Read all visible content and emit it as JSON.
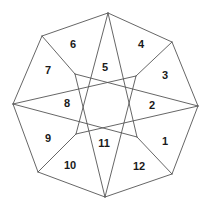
{
  "figure": {
    "canvas": {
      "width": 210,
      "height": 212
    },
    "style": {
      "background_color": "#ffffff",
      "stroke_color": "#555555",
      "stroke_width": 0.9,
      "label_color": "#1a1a1a",
      "label_font_size": 11
    },
    "vertices": {
      "outer": [
        {
          "name": "top",
          "x": 108,
          "y": 13
        },
        {
          "name": "upper-right",
          "x": 172,
          "y": 42
        },
        {
          "name": "right",
          "x": 198,
          "y": 106
        },
        {
          "name": "lower-right",
          "x": 172,
          "y": 174
        },
        {
          "name": "bottom",
          "x": 105,
          "y": 197
        },
        {
          "name": "lower-left",
          "x": 38,
          "y": 172
        },
        {
          "name": "left",
          "x": 13,
          "y": 104
        },
        {
          "name": "upper-left",
          "x": 42,
          "y": 36
        }
      ],
      "inner": [
        {
          "name": "center",
          "x": 107,
          "y": 107
        },
        {
          "name": "inner-upper-left",
          "x": 75,
          "y": 74
        },
        {
          "name": "inner-upper-right",
          "x": 136,
          "y": 76
        },
        {
          "name": "inner-lower-left",
          "x": 76,
          "y": 134
        },
        {
          "name": "inner-lower-right",
          "x": 137,
          "y": 137
        }
      ]
    },
    "edges": [
      {
        "name": "outer-top-to-upper-right",
        "x1": 108,
        "y1": 13,
        "x2": 172,
        "y2": 42
      },
      {
        "name": "outer-upper-right-to-right",
        "x1": 172,
        "y1": 42,
        "x2": 198,
        "y2": 106
      },
      {
        "name": "outer-right-to-lower-right",
        "x1": 198,
        "y1": 106,
        "x2": 172,
        "y2": 174
      },
      {
        "name": "outer-lower-right-to-bottom",
        "x1": 172,
        "y1": 174,
        "x2": 105,
        "y2": 197
      },
      {
        "name": "outer-bottom-to-lower-left",
        "x1": 105,
        "y1": 197,
        "x2": 38,
        "y2": 172
      },
      {
        "name": "outer-lower-left-to-left",
        "x1": 38,
        "y1": 172,
        "x2": 13,
        "y2": 104
      },
      {
        "name": "outer-left-to-upper-left",
        "x1": 13,
        "y1": 104,
        "x2": 42,
        "y2": 36
      },
      {
        "name": "outer-upper-left-to-top",
        "x1": 42,
        "y1": 36,
        "x2": 108,
        "y2": 13
      },
      {
        "name": "diagonal-top-to-inner-lower-left",
        "x1": 108,
        "y1": 13,
        "x2": 76,
        "y2": 134
      },
      {
        "name": "diagonal-top-to-inner-lower-right",
        "x1": 108,
        "y1": 13,
        "x2": 137,
        "y2": 137
      },
      {
        "name": "diagonal-left-to-inner-upper-right",
        "x1": 13,
        "y1": 104,
        "x2": 136,
        "y2": 76
      },
      {
        "name": "diagonal-left-to-inner-lower-right",
        "x1": 13,
        "y1": 104,
        "x2": 137,
        "y2": 137
      },
      {
        "name": "diagonal-right-to-inner-upper-left",
        "x1": 198,
        "y1": 106,
        "x2": 75,
        "y2": 74
      },
      {
        "name": "diagonal-right-to-inner-lower-left",
        "x1": 198,
        "y1": 106,
        "x2": 76,
        "y2": 134
      },
      {
        "name": "diagonal-bottom-to-inner-upper-left",
        "x1": 105,
        "y1": 197,
        "x2": 75,
        "y2": 74
      },
      {
        "name": "diagonal-bottom-to-inner-upper-right",
        "x1": 105,
        "y1": 197,
        "x2": 136,
        "y2": 76
      },
      {
        "name": "chord-upper-left-to-inner-upper-left",
        "x1": 42,
        "y1": 36,
        "x2": 75,
        "y2": 74
      },
      {
        "name": "chord-upper-right-to-inner-upper-right",
        "x1": 172,
        "y1": 42,
        "x2": 136,
        "y2": 76
      },
      {
        "name": "chord-lower-left-to-inner-lower-left",
        "x1": 38,
        "y1": 172,
        "x2": 76,
        "y2": 134
      },
      {
        "name": "chord-lower-right-to-inner-lower-right",
        "x1": 172,
        "y1": 174,
        "x2": 137,
        "y2": 137
      }
    ],
    "regions": [
      {
        "id": "region-1",
        "label": "1",
        "x": 165,
        "y": 141
      },
      {
        "id": "region-2",
        "label": "2",
        "x": 152,
        "y": 105
      },
      {
        "id": "region-3",
        "label": "3",
        "x": 165,
        "y": 75
      },
      {
        "id": "region-4",
        "label": "4",
        "x": 141,
        "y": 44
      },
      {
        "id": "region-5",
        "label": "5",
        "x": 105,
        "y": 67
      },
      {
        "id": "region-6",
        "label": "6",
        "x": 73,
        "y": 44
      },
      {
        "id": "region-7",
        "label": "7",
        "x": 48,
        "y": 70
      },
      {
        "id": "region-8",
        "label": "8",
        "x": 67,
        "y": 103
      },
      {
        "id": "region-9",
        "label": "9",
        "x": 48,
        "y": 138
      },
      {
        "id": "region-10",
        "label": "10",
        "x": 70,
        "y": 165
      },
      {
        "id": "region-11",
        "label": "11",
        "x": 104,
        "y": 143
      },
      {
        "id": "region-12",
        "label": "12",
        "x": 139,
        "y": 166
      }
    ]
  }
}
